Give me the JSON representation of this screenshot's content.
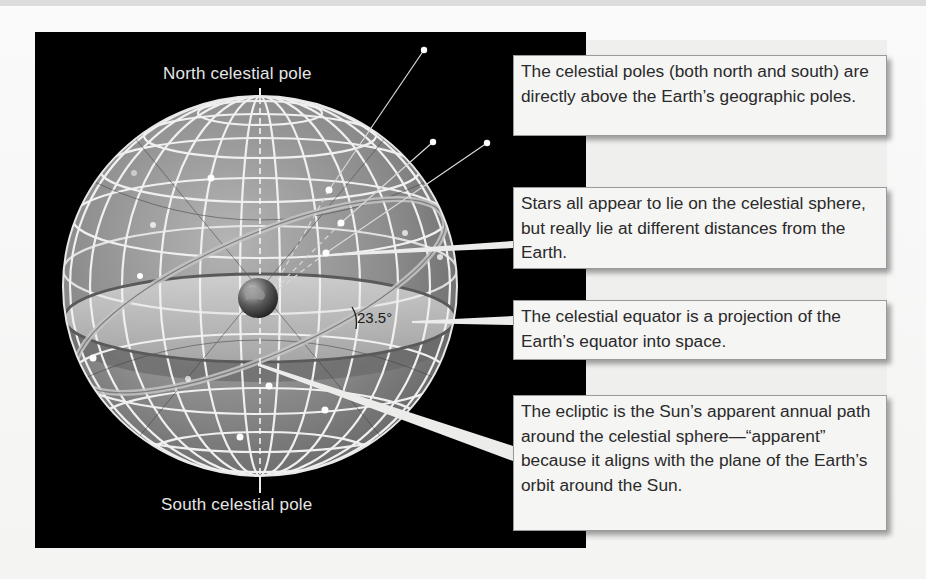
{
  "diagram": {
    "title": "Celestial sphere",
    "labels": {
      "north_pole": "North celestial pole",
      "south_pole": "South celestial pole",
      "angle": "23.5°"
    },
    "callouts": [
      {
        "id": "poles",
        "text": "The celestial poles (both north and south) are directly above the Earth’s geographic poles."
      },
      {
        "id": "stars",
        "text": "Stars all appear to lie on the celestial sphere, but really lie at different distances from the Earth."
      },
      {
        "id": "equator",
        "text": "The celestial equator is a projection of the Earth’s equator into space."
      },
      {
        "id": "ecliptic",
        "text": "The ecliptic is the Sun’s apparent annual path around the celestial sphere—“apparent” because it aligns with the plane of the Earth’s orbit around the Sun."
      }
    ],
    "colors": {
      "background_panel": "#000000",
      "sphere_fill": "#8a8a8a",
      "grid_lines": "#f0f0f0",
      "callout_fill": "#f5f5f4",
      "callout_border": "#9a9a9a",
      "text_dark": "#2a2a2a",
      "text_light": "#e6e6e6"
    }
  }
}
